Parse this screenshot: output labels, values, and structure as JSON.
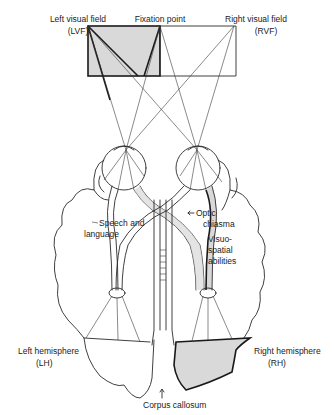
{
  "labels": {
    "left_visual_field": "Left visual field",
    "left_visual_field_abbr": "(LVF)",
    "fixation_point": "Fixation point",
    "right_visual_field": "Right visual field",
    "right_visual_field_abbr": "(RVF)",
    "speech_language_1": "Speech and",
    "speech_language_2": "language",
    "optic_chiasma_1": "Optic",
    "optic_chiasma_2": "chiasma",
    "visuo_spatial_1": "Visuo-",
    "visuo_spatial_2": "spatial",
    "visuo_spatial_3": "abilities",
    "left_hemisphere": "Left hemisphere",
    "left_hemisphere_abbr": "(LH)",
    "right_hemisphere": "Right hemisphere",
    "right_hemisphere_abbr": "(RH)",
    "corpus_callosum": "Corpus callosum"
  },
  "colors": {
    "ink": "#2a2a2a",
    "shade": "#d9d9d9",
    "background": "#ffffff"
  }
}
